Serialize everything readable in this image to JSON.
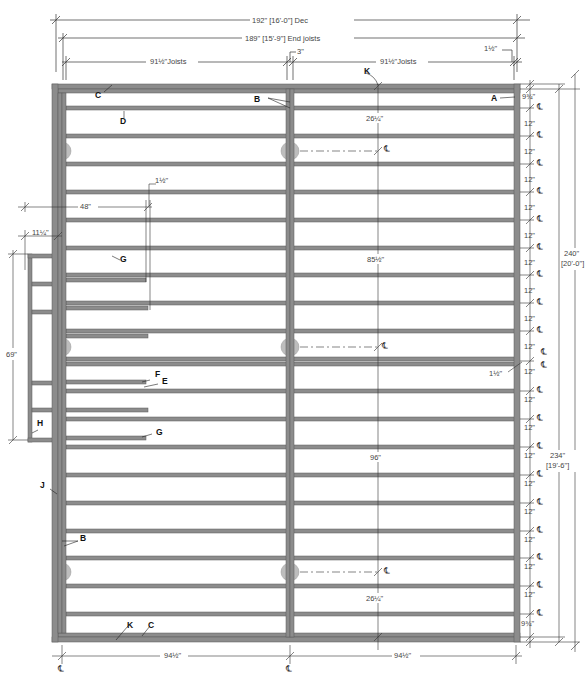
{
  "drawing": {
    "title": "Floor framing plan",
    "colors": {
      "lumber_fill": "#8c8c8c",
      "lumber_edge": "#5a5a5a",
      "dimension_line": "#333333",
      "pier": "#bdbdbd",
      "background": "#ffffff"
    }
  },
  "top_dimensions": {
    "overall": "192\" [16'-0\"] Dec",
    "end_joists": "189\" [15'-9\"] End joists",
    "left_joists": "91½\"Joists",
    "right_joists": "91½\"Joists",
    "beam_gap": "3\"",
    "rim_offset": "1½\""
  },
  "right_dimensions": {
    "spacings": [
      "9¾\"",
      "12\"",
      "12\"",
      "12\"",
      "12\"",
      "12\"",
      "12\"",
      "12\"",
      "12\"",
      "12\"",
      "12\"",
      "12\"",
      "12\"",
      "12\"",
      "12\"",
      "12\"",
      "12\"",
      "12\"",
      "12\"",
      "9¾\""
    ],
    "overall_outer": "240\"",
    "overall_outer_ft": "[20'-0\"]",
    "overall_inner": "234\"",
    "overall_inner_ft": "[19'-6\"]",
    "center_offset": "1½\"",
    "centerline_symbol": "℄"
  },
  "left_dimensions": {
    "opening_width": "48\"",
    "opening_offset": "11¼\"",
    "landing_height": "69\"",
    "header_gap": "1½\""
  },
  "interior_dimensions": {
    "top_pier": "26¼\"",
    "mid_upper": "85½\"",
    "mid_lower": "96\"",
    "bottom_pier": "26¼\""
  },
  "bottom_dimensions": {
    "left_half": "94½\"",
    "right_half": "94½\"",
    "centerline_symbol": "℄"
  },
  "callouts": {
    "A": "A",
    "B": "B",
    "C": "C",
    "D": "D",
    "E": "E",
    "F": "F",
    "G": "G",
    "H": "H",
    "J": "J",
    "K": "K"
  }
}
